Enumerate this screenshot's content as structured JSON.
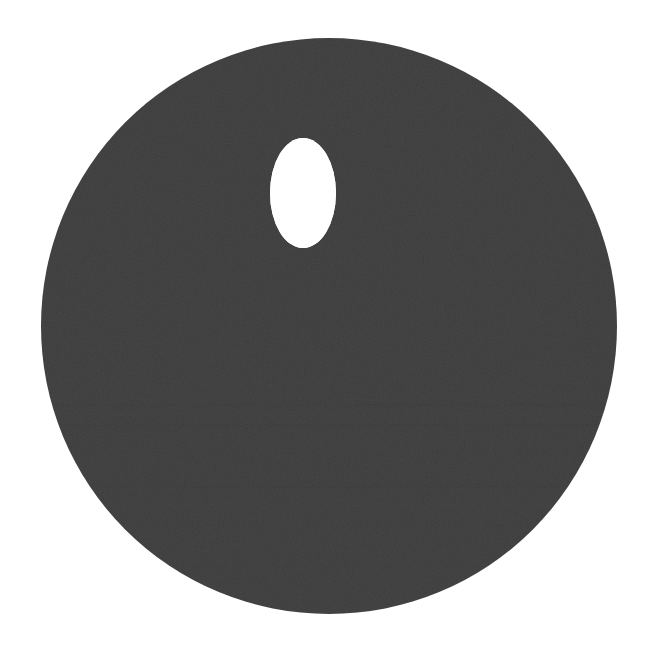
{
  "canvas": {
    "width": 652,
    "height": 654,
    "background_color": "#ffffff",
    "title": "Dark disc with oval hole"
  },
  "palette": {
    "disc_fill": "#3d3d3d",
    "disc_fill_light": "#434343",
    "disc_fill_dark": "#383838",
    "hole_fill": "#ffffff",
    "background": "#ffffff"
  },
  "shapes": {
    "disc": {
      "name": "dark-disc",
      "type": "circle",
      "cx": 329,
      "cy": 326,
      "r": 288,
      "fill": "#3d3d3d",
      "bounds": {
        "left": 41,
        "top": 38,
        "right": 617,
        "bottom": 615
      }
    },
    "hole": {
      "name": "oval-hole",
      "type": "ellipse",
      "cx": 303,
      "cy": 193,
      "rx": 33,
      "ry": 55,
      "fill": "#ffffff",
      "bounds": {
        "left": 270,
        "top": 138,
        "right": 336,
        "bottom": 248
      }
    }
  },
  "texture": {
    "name": "horizontal-banding",
    "description": "faint horizontal scan-line banding across the lower-middle of the disc",
    "bands": [
      {
        "y": 398,
        "height": 3,
        "color": "#434343",
        "opacity": 0.35
      },
      {
        "y": 404,
        "height": 2,
        "color": "#383838",
        "opacity": 0.3
      },
      {
        "y": 412,
        "height": 4,
        "color": "#414141",
        "opacity": 0.28
      },
      {
        "y": 424,
        "height": 2,
        "color": "#373737",
        "opacity": 0.25
      },
      {
        "y": 436,
        "height": 3,
        "color": "#424242",
        "opacity": 0.22
      },
      {
        "y": 452,
        "height": 2,
        "color": "#393939",
        "opacity": 0.22
      },
      {
        "y": 468,
        "height": 3,
        "color": "#414141",
        "opacity": 0.2
      },
      {
        "y": 486,
        "height": 2,
        "color": "#383838",
        "opacity": 0.2
      },
      {
        "y": 504,
        "height": 3,
        "color": "#424242",
        "opacity": 0.18
      },
      {
        "y": 524,
        "height": 2,
        "color": "#393939",
        "opacity": 0.18
      },
      {
        "y": 546,
        "height": 3,
        "color": "#414141",
        "opacity": 0.16
      },
      {
        "y": 566,
        "height": 2,
        "color": "#383838",
        "opacity": 0.14
      }
    ]
  },
  "labels": {
    "figure_caption": "",
    "annotations": []
  }
}
